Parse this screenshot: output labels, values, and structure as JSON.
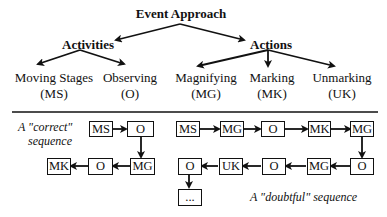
{
  "hierarchy": {
    "root": "Event Approach",
    "groups": [
      {
        "label": "Activities",
        "children": [
          {
            "name": "Moving Stages",
            "abbr": "(MS)"
          },
          {
            "name": "Observing",
            "abbr": "(O)"
          }
        ]
      },
      {
        "label": "Actions",
        "children": [
          {
            "name": "Magnifying",
            "abbr": "(MG)"
          },
          {
            "name": "Marking",
            "abbr": "(MK)"
          },
          {
            "name": "Unmarking",
            "abbr": "(UK)"
          }
        ]
      }
    ]
  },
  "correct_sequence": {
    "caption_line1": "A \"correct\"",
    "caption_line2": "sequence",
    "nodes": [
      "MS",
      "O",
      "MG",
      "O",
      "MK"
    ]
  },
  "doubtful_sequence": {
    "caption": "A \"doubtful\" sequence",
    "nodes": [
      "MS",
      "MG",
      "O",
      "MK",
      "MG",
      "O",
      "MG",
      "O",
      "UK",
      "O",
      "..."
    ]
  }
}
